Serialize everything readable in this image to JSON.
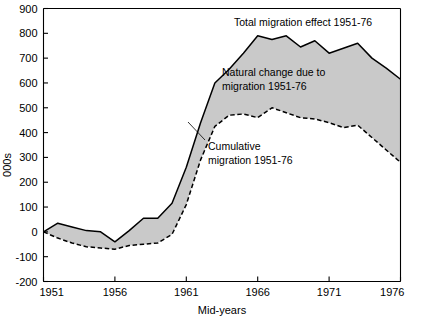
{
  "chart_data": {
    "type": "area",
    "title": "",
    "xlabel": "Mid-years",
    "ylabel": "000s",
    "xlim": [
      1951,
      1976
    ],
    "ylim": [
      -200,
      900
    ],
    "grid": false,
    "legend_position": "inline-annotations",
    "xticks": [
      "1951",
      "1956",
      "1961",
      "1966",
      "1971",
      "1976"
    ],
    "xtick_values": [
      1951,
      1956,
      1961,
      1966,
      1971,
      1976
    ],
    "yticks": [
      "900",
      "800",
      "700",
      "600",
      "500",
      "400",
      "300",
      "200",
      "100",
      "0",
      "-100",
      "-200"
    ],
    "ytick_values": [
      900,
      800,
      700,
      600,
      500,
      400,
      300,
      200,
      100,
      0,
      -100,
      -200
    ],
    "x": [
      1951,
      1952,
      1953,
      1954,
      1955,
      1956,
      1957,
      1958,
      1959,
      1960,
      1961,
      1962,
      1963,
      1964,
      1965,
      1966,
      1967,
      1968,
      1969,
      1970,
      1971,
      1972,
      1973,
      1974,
      1975,
      1976
    ],
    "series": [
      {
        "name": "Total migration effect 1951-76",
        "style": "solid",
        "values": [
          0,
          35,
          20,
          5,
          0,
          -40,
          5,
          55,
          55,
          115,
          260,
          440,
          600,
          655,
          720,
          790,
          775,
          790,
          745,
          770,
          720,
          740,
          760,
          700,
          660,
          615
        ]
      },
      {
        "name": "Cumulative migration 1951-76",
        "style": "dashed",
        "values": [
          0,
          -25,
          -45,
          -60,
          -65,
          -70,
          -55,
          -50,
          -45,
          -10,
          110,
          290,
          425,
          470,
          475,
          460,
          500,
          480,
          460,
          455,
          440,
          420,
          430,
          380,
          330,
          280
        ]
      }
    ],
    "band": {
      "name": "Natural change due to migration 1951-76",
      "fill_color": "#c9c9c9",
      "between": [
        "Total migration effect 1951-76",
        "Cumulative migration 1951-76"
      ]
    },
    "annotations": [
      {
        "id": "total",
        "text": "Total migration effect  1951-76",
        "lines": [
          "Total migration effect  1951-76"
        ]
      },
      {
        "id": "natural",
        "text": "Natural change due to migration 1951-76",
        "lines": [
          "Natural change due to",
          "migration 1951-76"
        ]
      },
      {
        "id": "cumulative",
        "text": "Cumulative migration 1951-76",
        "lines": [
          "Cumulative",
          "migration 1951-76"
        ]
      }
    ],
    "colors": {
      "band_fill": "#c9c9c9",
      "line": "#000000",
      "axis": "#000000",
      "background": "#ffffff"
    }
  }
}
